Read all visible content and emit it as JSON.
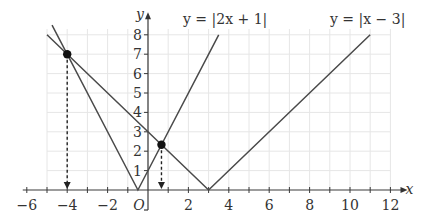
{
  "chart_data": {
    "type": "line",
    "title": "",
    "xlabel": "x",
    "ylabel": "y",
    "origin_label": "O",
    "xlim": [
      -6,
      12.5
    ],
    "ylim": [
      0,
      8.6
    ],
    "xticks": [
      -6,
      -4,
      -2,
      2,
      4,
      6,
      8,
      10,
      12
    ],
    "yticks": [
      1,
      2,
      3,
      4,
      5,
      6,
      7,
      8
    ],
    "grid": true,
    "series": [
      {
        "name": "y = |2x + 1|",
        "label": "y = |2x + 1|",
        "x": [
          -4.75,
          -0.5,
          3.5
        ],
        "y": [
          8.5,
          0,
          8
        ]
      },
      {
        "name": "y = |x − 3|",
        "label": "y = |x − 3|",
        "x": [
          -5,
          3,
          11
        ],
        "y": [
          8,
          0,
          8
        ]
      }
    ],
    "intersections": [
      {
        "x": -4,
        "y": 7
      },
      {
        "x": 0.6667,
        "y": 2.3333
      }
    ],
    "annotations": [
      "dashed arrows from intersection points down to x-axis"
    ]
  }
}
